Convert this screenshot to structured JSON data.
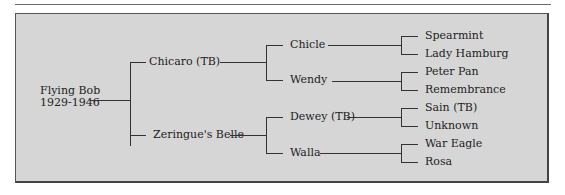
{
  "pedigree": {
    "subject": {
      "name": "Flying Bob",
      "years": "1929-1946"
    },
    "sire": {
      "name": "Chicaro (TB)",
      "sire": {
        "name": "Chicle",
        "sire": "Spearmint",
        "dam": "Lady Hamburg"
      },
      "dam": {
        "name": "Wendy",
        "sire": "Peter Pan",
        "dam": "Remembrance"
      }
    },
    "dam": {
      "name": "Zeringue's Belle",
      "sire": {
        "name": "Dewey (TB)",
        "sire": "Sain (TB)",
        "dam": "Unknown"
      },
      "dam": {
        "name": "Walla",
        "sire": "War Eagle",
        "dam": "Rosa"
      }
    }
  }
}
